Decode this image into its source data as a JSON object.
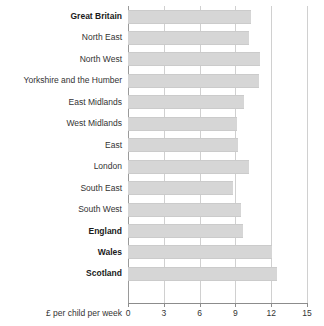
{
  "chart_data": {
    "type": "bar",
    "orientation": "horizontal",
    "title": "",
    "subtitle": "",
    "xlabel": "£ per child per week",
    "ylabel": "",
    "xlim": [
      0,
      15
    ],
    "xticks": [
      0,
      3,
      6,
      9,
      12,
      15
    ],
    "xtick_labels": [
      "0",
      "3",
      "6",
      "9",
      "12",
      "15"
    ],
    "grid": "vertical",
    "legend": null,
    "bar_color": "#d6d6d6",
    "bar_edge_color": "#cbcbcb",
    "categories": [
      "Great Britain",
      "North East",
      "North West",
      "Yorkshire and the Humber",
      "East Midlands",
      "West Midlands",
      "East",
      "London",
      "South East",
      "South West",
      "England",
      "Wales",
      "Scotland"
    ],
    "emphasised_categories": [
      "Great Britain",
      "England",
      "Wales",
      "Scotland"
    ],
    "values": [
      10.3,
      10.1,
      11.1,
      11.0,
      9.7,
      9.1,
      9.2,
      10.1,
      8.8,
      9.5,
      9.6,
      12.1,
      12.5
    ],
    "series": [
      {
        "name": "Pocket money",
        "values": [
          10.3,
          10.1,
          11.1,
          11.0,
          9.7,
          9.1,
          9.2,
          10.1,
          8.8,
          9.5,
          9.6,
          12.1,
          12.5
        ]
      }
    ]
  }
}
